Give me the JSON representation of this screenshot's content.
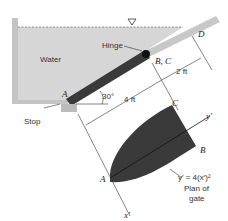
{
  "labels": {
    "water": "Water",
    "hinge": "Hinge",
    "bc": "B, C",
    "d": "D",
    "a_top": "A",
    "angle": "30°",
    "len_4ft": "4 ft",
    "len_2ft": "2 ft",
    "stop": "Stop",
    "c_plan": "C",
    "b_plan": "B",
    "a_plan": "A",
    "y_axis": "y′",
    "x_axis": "x′",
    "equation": "y′ = 4(x′)²",
    "plan_line1": "Plan of",
    "plan_line2": "gate"
  },
  "colors": {
    "water": "#d6d6d6",
    "gate": "#3a3a3a",
    "wall": "#bdbdbd",
    "line": "#333333"
  }
}
